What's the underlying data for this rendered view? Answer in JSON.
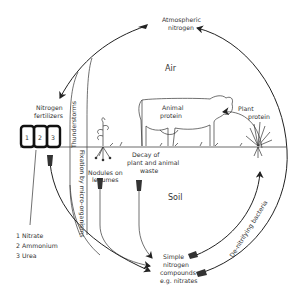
{
  "diagram": {
    "regions": {
      "air": "Air",
      "soil": "Soil"
    },
    "nodes": {
      "atmospheric_nitrogen": {
        "line1": "Atmospheric",
        "line2": "nitrogen"
      },
      "nitrogen_fertilizers": {
        "line1": "Nitrogen",
        "line2": "fertilizers"
      },
      "animal_protein": {
        "line1": "Animal",
        "line2": "protein"
      },
      "plant_protein": {
        "line1": "Plant",
        "line2": "protein"
      },
      "decay": {
        "line1": "Decay of",
        "line2": "plant and animal",
        "line3": "waste"
      },
      "nodules": {
        "line1": "Nodules on",
        "line2": "legumes"
      },
      "simple_compounds": {
        "line1": "Simple",
        "line2": "nitrogen",
        "line3": "compounds",
        "line4": "e.g. nitrates"
      }
    },
    "process_labels": {
      "thunderstorms": "Thunderstorms",
      "fixation": "Fixation by micro-organisms",
      "denitrifying": "De-nitrifying bacteria"
    },
    "fertilizer_bags": [
      "1",
      "2",
      "3"
    ],
    "legend": [
      {
        "num": "1",
        "label": "Nitrate"
      },
      {
        "num": "2",
        "label": "Ammonium"
      },
      {
        "num": "3",
        "label": "Urea"
      }
    ],
    "colors": {
      "line": "#222222",
      "text": "#333333",
      "background": "#ffffff"
    }
  }
}
